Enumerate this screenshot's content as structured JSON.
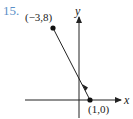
{
  "problem": {
    "number": "15."
  },
  "axes": {
    "x_label": "x",
    "y_label": "y"
  },
  "points": [
    {
      "label": "(−3,8)",
      "x": -3,
      "y": 8
    },
    {
      "label": "(1,0)",
      "x": 1,
      "y": 0
    }
  ],
  "segment": {
    "from": "(1,0)",
    "to": "(−3,8)",
    "arrow_direction": "toward (−3,8)"
  },
  "colors": {
    "problem_number": "#5b8fc7",
    "ink": "#222222"
  }
}
